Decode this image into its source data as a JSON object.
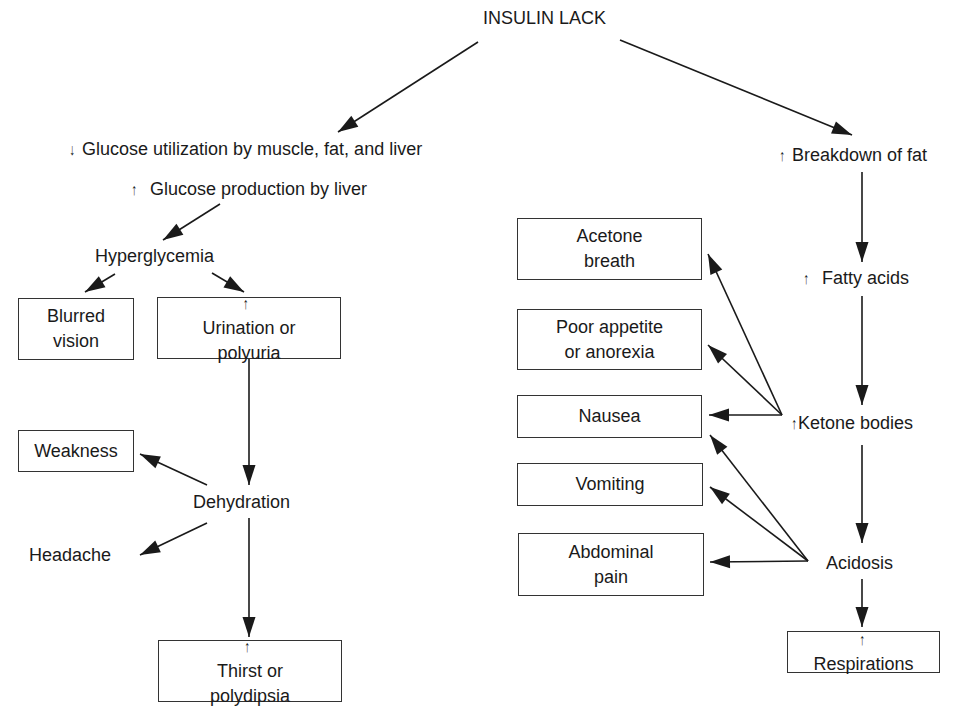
{
  "root": "INSULIN LACK",
  "left_branch": {
    "glucose_utilization": {
      "arrow": "↓",
      "text": "Glucose utilization by muscle, fat, and liver"
    },
    "glucose_production": {
      "arrow": "↑",
      "text": "Glucose production by liver"
    },
    "hyperglycemia": "Hyperglycemia",
    "blurred_vision": [
      "Blurred",
      "vision"
    ],
    "urination": {
      "arrow": "↑",
      "line1": "Urination or",
      "line2": "polyuria"
    },
    "weakness": "Weakness",
    "dehydration": "Dehydration",
    "headache": "Headache",
    "thirst": {
      "arrow": "↑",
      "line1": "Thirst or",
      "line2": "polydipsia"
    }
  },
  "right_branch": {
    "breakdown_of_fat": {
      "arrow": "↑",
      "text": "Breakdown of fat"
    },
    "fatty_acids": {
      "arrow": "↑",
      "text": "Fatty acids"
    },
    "ketone_bodies": {
      "arrow": "↑",
      "text": "Ketone bodies"
    },
    "acidosis": "Acidosis",
    "respirations": {
      "arrow": "↑",
      "text": "Respirations"
    },
    "acetone_breath": [
      "Acetone",
      "breath"
    ],
    "poor_appetite": [
      "Poor appetite",
      "or anorexia"
    ],
    "nausea": "Nausea",
    "vomiting": "Vomiting",
    "abdominal_pain": [
      "Abdominal",
      "pain"
    ]
  }
}
